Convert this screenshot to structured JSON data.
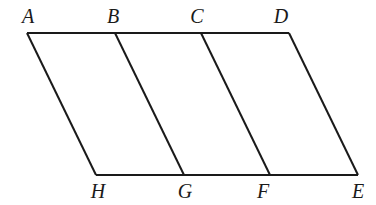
{
  "figure": {
    "background_color": "#ffffff",
    "line_color": "#1a1a1a",
    "line_width": 2,
    "canvas": {
      "width": 376,
      "height": 205
    },
    "labels": {
      "A": "A",
      "B": "B",
      "C": "C",
      "D": "D",
      "E": "E",
      "F": "F",
      "G": "G",
      "H": "H"
    },
    "label_positions": [
      {
        "key": "A",
        "text": "A",
        "x": 28,
        "y": 6
      },
      {
        "key": "B",
        "text": "B",
        "x": 113,
        "y": 6
      },
      {
        "key": "C",
        "text": "C",
        "x": 197,
        "y": 6
      },
      {
        "key": "D",
        "text": "D",
        "x": 281,
        "y": 6
      },
      {
        "key": "H",
        "text": "H",
        "x": 98,
        "y": 181
      },
      {
        "key": "G",
        "text": "G",
        "x": 185,
        "y": 181
      },
      {
        "key": "F",
        "text": "F",
        "x": 263,
        "y": 181
      },
      {
        "key": "E",
        "text": "E",
        "x": 358,
        "y": 181
      }
    ],
    "vertices": [
      {
        "key": "A",
        "x": 27,
        "y": 33
      },
      {
        "key": "B",
        "x": 115,
        "y": 33
      },
      {
        "key": "C",
        "x": 201,
        "y": 33
      },
      {
        "key": "D",
        "x": 289,
        "y": 33
      },
      {
        "key": "H",
        "x": 96,
        "y": 175
      },
      {
        "key": "G",
        "x": 184,
        "y": 175
      },
      {
        "key": "F",
        "x": 270,
        "y": 175
      },
      {
        "key": "E",
        "x": 358,
        "y": 175
      }
    ],
    "segments": [
      {
        "name": "top-edge-AD",
        "x1": 27,
        "y1": 33,
        "x2": 289,
        "y2": 33
      },
      {
        "name": "bottom-edge-HE",
        "x1": 96,
        "y1": 175,
        "x2": 358,
        "y2": 175
      },
      {
        "name": "side-AH",
        "x1": 27,
        "y1": 33,
        "x2": 96,
        "y2": 175
      },
      {
        "name": "divider-BG",
        "x1": 115,
        "y1": 33,
        "x2": 184,
        "y2": 175
      },
      {
        "name": "divider-CF",
        "x1": 201,
        "y1": 33,
        "x2": 270,
        "y2": 175
      },
      {
        "name": "side-DE",
        "x1": 289,
        "y1": 33,
        "x2": 358,
        "y2": 175
      }
    ]
  }
}
